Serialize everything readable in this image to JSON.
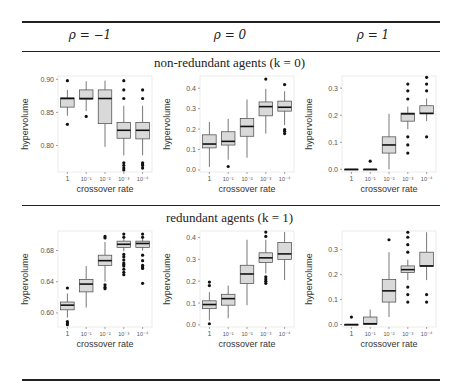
{
  "table": {
    "columns": [
      "ρ = −1",
      "ρ = 0",
      "ρ = 1"
    ],
    "sections": [
      {
        "title": "non-redundant agents (k = 0)"
      },
      {
        "title": "redundant agents (k = 1)"
      }
    ]
  },
  "chart_data": [
    {
      "type": "box",
      "title": "non-redundant agents (k = 0), ρ = −1",
      "xlabel": "crossover rate",
      "ylabel": "hypervolume",
      "categories": [
        "1",
        "10⁻¹",
        "10⁻²",
        "10⁻³",
        "10⁻⁴"
      ],
      "ylim": [
        0.76,
        0.905
      ],
      "yticks": [
        0.8,
        0.85,
        0.9
      ],
      "ytick_labels": [
        "0.80",
        "0.85",
        "0.90"
      ],
      "boxes": [
        {
          "min": 0.845,
          "q1": 0.858,
          "median": 0.871,
          "q3": 0.872,
          "max": 0.884,
          "outliers": [
            0.898,
            0.832
          ]
        },
        {
          "min": 0.852,
          "q1": 0.87,
          "median": 0.871,
          "q3": 0.884,
          "max": 0.897,
          "outliers": [
            0.844
          ]
        },
        {
          "min": 0.798,
          "q1": 0.833,
          "median": 0.871,
          "q3": 0.884,
          "max": 0.898,
          "outliers": []
        },
        {
          "min": 0.785,
          "q1": 0.811,
          "median": 0.823,
          "q3": 0.835,
          "max": 0.86,
          "outliers": [
            0.898,
            0.884,
            0.871,
            0.774,
            0.77,
            0.766,
            0.763
          ]
        },
        {
          "min": 0.785,
          "q1": 0.81,
          "median": 0.823,
          "q3": 0.835,
          "max": 0.86,
          "outliers": [
            0.884,
            0.871,
            0.774,
            0.772,
            0.77,
            0.766
          ]
        }
      ]
    },
    {
      "type": "box",
      "title": "non-redundant agents (k = 0), ρ = 0",
      "xlabel": "crossover rate",
      "ylabel": "hypervolume",
      "categories": [
        "1",
        "10⁻¹",
        "10⁻²",
        "10⁻³",
        "10⁻⁴"
      ],
      "ylim": [
        -0.01,
        0.46
      ],
      "yticks": [
        0.0,
        0.1,
        0.2,
        0.3,
        0.4
      ],
      "ytick_labels": [
        "0.0",
        "0.1",
        "0.2",
        "0.3",
        "0.4"
      ],
      "boxes": [
        {
          "min": 0.015,
          "q1": 0.108,
          "median": 0.127,
          "q3": 0.172,
          "max": 0.235,
          "outliers": []
        },
        {
          "min": 0.05,
          "q1": 0.122,
          "median": 0.14,
          "q3": 0.187,
          "max": 0.25,
          "outliers": [
            0.017
          ]
        },
        {
          "min": 0.06,
          "q1": 0.165,
          "median": 0.213,
          "q3": 0.252,
          "max": 0.345,
          "outliers": []
        },
        {
          "min": 0.178,
          "q1": 0.265,
          "median": 0.31,
          "q3": 0.333,
          "max": 0.397,
          "outliers": [
            0.445
          ]
        },
        {
          "min": 0.22,
          "q1": 0.288,
          "median": 0.307,
          "q3": 0.337,
          "max": 0.385,
          "outliers": [
            0.418,
            0.198,
            0.19,
            0.178
          ]
        }
      ]
    },
    {
      "type": "box",
      "title": "non-redundant agents (k = 0), ρ = 1",
      "xlabel": "crossover rate",
      "ylabel": "hypervolume",
      "categories": [
        "1",
        "10⁻¹",
        "10⁻²",
        "10⁻³",
        "10⁻⁴"
      ],
      "ylim": [
        -0.01,
        0.345
      ],
      "yticks": [
        0.0,
        0.1,
        0.2,
        0.3
      ],
      "ytick_labels": [
        "0.0",
        "0.1",
        "0.2",
        "0.3"
      ],
      "boxes": [
        {
          "min": 0.0,
          "q1": 0.0,
          "median": 0.0,
          "q3": 0.0,
          "max": 0.0,
          "outliers": []
        },
        {
          "min": 0.0,
          "q1": 0.0,
          "median": 0.0,
          "q3": 0.0,
          "max": 0.0,
          "outliers": [
            0.03
          ]
        },
        {
          "min": 0.0,
          "q1": 0.06,
          "median": 0.09,
          "q3": 0.12,
          "max": 0.205,
          "outliers": []
        },
        {
          "min": 0.148,
          "q1": 0.178,
          "median": 0.205,
          "q3": 0.208,
          "max": 0.232,
          "outliers": [
            0.315,
            0.29,
            0.26,
            0.12,
            0.09,
            0.06
          ]
        },
        {
          "min": 0.178,
          "q1": 0.205,
          "median": 0.207,
          "q3": 0.235,
          "max": 0.262,
          "outliers": [
            0.34,
            0.315,
            0.29,
            0.12
          ]
        }
      ]
    },
    {
      "type": "box",
      "title": "redundant agents (k = 1), ρ = −1",
      "xlabel": "crossover rate",
      "ylabel": "hypervolume",
      "categories": [
        "1",
        "10⁻¹",
        "10⁻²",
        "10⁻³",
        "10⁻⁴"
      ],
      "ylim": [
        0.582,
        0.705
      ],
      "yticks": [
        0.6,
        0.64,
        0.68
      ],
      "ytick_labels": [
        "0.60",
        "0.64",
        "0.68"
      ],
      "boxes": [
        {
          "min": 0.594,
          "q1": 0.604,
          "median": 0.61,
          "q3": 0.614,
          "max": 0.625,
          "outliers": [
            0.632,
            0.589,
            0.587,
            0.585
          ]
        },
        {
          "min": 0.607,
          "q1": 0.627,
          "median": 0.637,
          "q3": 0.643,
          "max": 0.66,
          "outliers": []
        },
        {
          "min": 0.64,
          "q1": 0.661,
          "median": 0.667,
          "q3": 0.674,
          "max": 0.691,
          "outliers": [
            0.698,
            0.696,
            0.636,
            0.633,
            0.631
          ]
        },
        {
          "min": 0.679,
          "q1": 0.684,
          "median": 0.688,
          "q3": 0.692,
          "max": 0.696,
          "outliers": [
            0.701,
            0.697,
            0.675,
            0.672,
            0.668,
            0.664,
            0.662,
            0.66,
            0.656,
            0.652,
            0.649
          ]
        },
        {
          "min": 0.68,
          "q1": 0.684,
          "median": 0.689,
          "q3": 0.692,
          "max": 0.696,
          "outliers": [
            0.701,
            0.697,
            0.674,
            0.667,
            0.661,
            0.659,
            0.657,
            0.638
          ]
        }
      ]
    },
    {
      "type": "box",
      "title": "redundant agents (k = 1), ρ = 0",
      "xlabel": "crossover rate",
      "ylabel": "hypervolume",
      "categories": [
        "1",
        "10⁻¹",
        "10⁻²",
        "10⁻³",
        "10⁻⁴"
      ],
      "ylim": [
        -0.01,
        0.43
      ],
      "yticks": [
        0.0,
        0.1,
        0.2,
        0.3,
        0.4
      ],
      "ytick_labels": [
        "0.0",
        "0.1",
        "0.2",
        "0.3",
        "0.4"
      ],
      "boxes": [
        {
          "min": 0.02,
          "q1": 0.074,
          "median": 0.093,
          "q3": 0.11,
          "max": 0.15,
          "outliers": [
            0.196,
            0.18,
            0.005
          ]
        },
        {
          "min": 0.03,
          "q1": 0.09,
          "median": 0.12,
          "q3": 0.14,
          "max": 0.18,
          "outliers": []
        },
        {
          "min": 0.09,
          "q1": 0.19,
          "median": 0.233,
          "q3": 0.273,
          "max": 0.39,
          "outliers": []
        },
        {
          "min": 0.235,
          "q1": 0.285,
          "median": 0.307,
          "q3": 0.33,
          "max": 0.39,
          "outliers": [
            0.425,
            0.405,
            0.22,
            0.21,
            0.2,
            0.19
          ]
        },
        {
          "min": 0.205,
          "q1": 0.3,
          "median": 0.325,
          "q3": 0.377,
          "max": 0.425,
          "outliers": []
        }
      ]
    },
    {
      "type": "box",
      "title": "redundant agents (k = 1), ρ = 1",
      "xlabel": "crossover rate",
      "ylabel": "hypervolume",
      "categories": [
        "1",
        "10⁻¹",
        "10⁻²",
        "10⁻³",
        "10⁻⁴"
      ],
      "ylim": [
        -0.01,
        0.375
      ],
      "yticks": [
        0.0,
        0.1,
        0.2,
        0.3
      ],
      "ytick_labels": [
        "0.0",
        "0.1",
        "0.2",
        "0.3"
      ],
      "boxes": [
        {
          "min": 0.0,
          "q1": 0.0,
          "median": 0.0,
          "q3": 0.0,
          "max": 0.0,
          "outliers": [
            0.03
          ]
        },
        {
          "min": 0.0,
          "q1": 0.0,
          "median": 0.003,
          "q3": 0.03,
          "max": 0.06,
          "outliers": []
        },
        {
          "min": 0.03,
          "q1": 0.09,
          "median": 0.135,
          "q3": 0.18,
          "max": 0.29,
          "outliers": [
            0.34
          ]
        },
        {
          "min": 0.178,
          "q1": 0.208,
          "median": 0.22,
          "q3": 0.235,
          "max": 0.26,
          "outliers": [
            0.37,
            0.35,
            0.32,
            0.29,
            0.15,
            0.12,
            0.09
          ]
        },
        {
          "min": 0.178,
          "q1": 0.233,
          "median": 0.235,
          "q3": 0.29,
          "max": 0.37,
          "outliers": [
            0.12,
            0.09
          ]
        }
      ]
    }
  ]
}
